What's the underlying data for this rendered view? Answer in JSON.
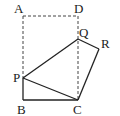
{
  "diagram": {
    "labels": {
      "A": "A",
      "D": "D",
      "Q": "Q",
      "R": "R",
      "P": "P",
      "B": "B",
      "C": "C"
    },
    "colors": {
      "line": "#222222",
      "dashed": "#444444",
      "background": "#ffffff"
    }
  }
}
